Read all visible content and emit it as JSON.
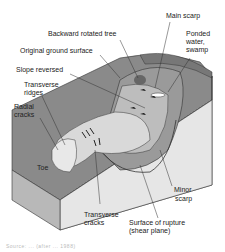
{
  "figure": {
    "labels": {
      "main_scarp": "Main scarp",
      "backward_rotated_tree": "Backward rotated tree",
      "ponded_water_1": "Ponded",
      "ponded_water_2": "water,",
      "ponded_water_3": "swamp",
      "original_ground_surface": "Original ground surface",
      "slope_reversed": "Slope reversed",
      "transverse_ridges_1": "Transverse",
      "transverse_ridges_2": "ridges",
      "radial_cracks_1": "Radial",
      "radial_cracks_2": "cracks",
      "toe": "Toe",
      "minor_scarp_1": "Minor",
      "minor_scarp_2": "scarp",
      "transverse_cracks_1": "Transverse",
      "transverse_cracks_2": "cracks",
      "surface_of_rupture_1": "Surface of rupture",
      "surface_of_rupture_2": "(shear plane)"
    },
    "caption": "Source: ... (after ... 1988)"
  },
  "colors": {
    "ground_surface": "#8a8a8a",
    "block_side": "#dcdcdc",
    "block_front": "#b5b5b5",
    "slump_body": "#cfcfcf",
    "text": "#222222"
  }
}
